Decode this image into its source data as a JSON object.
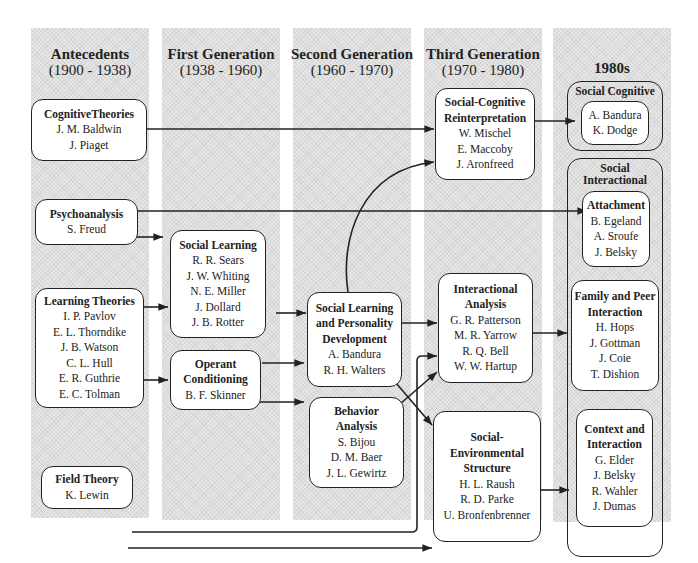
{
  "columns": [
    {
      "title": "Antecedents",
      "period": "(1900 - 1938)"
    },
    {
      "title": "First Generation",
      "period": "(1938 - 1960)"
    },
    {
      "title": "Second Generation",
      "period": "(1960 - 1970)"
    },
    {
      "title": "Third Generation",
      "period": "(1970 - 1980)"
    },
    {
      "title": "1980s",
      "period": ""
    }
  ],
  "nodes": {
    "cognitive_theories": {
      "title": "CognitiveTheories",
      "names": [
        "J. M. Baldwin",
        "J. Piaget"
      ]
    },
    "psychoanalysis": {
      "title": "Psychoanalysis",
      "names": [
        "S. Freud"
      ]
    },
    "learning_theories": {
      "title": "Learning Theories",
      "names": [
        "I. P. Pavlov",
        "E. L. Thorndike",
        "J. B. Watson",
        "C. L. Hull",
        "E. R. Guthrie",
        "E. C. Tolman"
      ]
    },
    "field_theory": {
      "title": "Field Theory",
      "names": [
        "K. Lewin"
      ]
    },
    "social_learning": {
      "title": "Social Learning",
      "names": [
        "R. R. Sears",
        "J. W. Whiting",
        "N. E. Miller",
        "J. Dollard",
        "J. B. Rotter"
      ]
    },
    "operant_conditioning": {
      "title_1": "Operant",
      "title_2": "Conditioning",
      "names": [
        "B. F. Skinner"
      ]
    },
    "social_learning_personality": {
      "title_1": "Social Learning",
      "title_2": "and Personality",
      "title_3": "Development",
      "names": [
        "A. Bandura",
        "R. H. Walters"
      ]
    },
    "behavior_analysis": {
      "title_1": "Behavior",
      "title_2": "Analysis",
      "names": [
        "S. Bijou",
        "D. M. Baer",
        "J. L. Gewirtz"
      ]
    },
    "social_cognitive_reinterpretation": {
      "title_1": "Social-Cognitive",
      "title_2": "Reinterpretation",
      "names": [
        "W. Mischel",
        "E. Maccoby",
        "J. Aronfreed"
      ]
    },
    "interactional_analysis": {
      "title_1": "Interactional",
      "title_2": "Analysis",
      "names": [
        "G. R. Patterson",
        "M. R. Yarrow",
        "R. Q. Bell",
        "W. W. Hartup"
      ]
    },
    "social_environmental_structure": {
      "title_1": "Social-",
      "title_2": "Environmental",
      "title_3": "Structure",
      "names": [
        "H. L. Raush",
        "R. D. Parke",
        "U. Bronfenbrenner"
      ]
    },
    "social_cognitive_group": {
      "label": "Social Cognitive",
      "names": [
        "A. Bandura",
        "K. Dodge"
      ]
    },
    "social_interactional_group": {
      "label": "Social Interactional"
    },
    "attachment": {
      "title": "Attachment",
      "names": [
        "B. Egeland",
        "A. Sroufe",
        "J. Belsky"
      ]
    },
    "family_peer": {
      "title_1": "Family and Peer",
      "title_2": "Interaction",
      "names": [
        "H. Hops",
        "J. Gottman",
        "J. Coie",
        "T. Dishion"
      ]
    },
    "context_interaction": {
      "title_1": "Context and",
      "title_2": "Interaction",
      "names": [
        "G. Elder",
        "J. Belsky",
        "R. Wahler",
        "J. Dumas"
      ]
    }
  },
  "edges": [
    {
      "from": "Cognitive Theories",
      "to": "Social-Cognitive Reinterpretation"
    },
    {
      "from": "Psychoanalysis",
      "to": "Attachment"
    },
    {
      "from": "Psychoanalysis",
      "to": "Social Learning"
    },
    {
      "from": "Learning Theories",
      "to": "Social Learning"
    },
    {
      "from": "Learning Theories",
      "to": "Operant Conditioning"
    },
    {
      "from": "Social Learning",
      "to": "Social Learning and Personality Development"
    },
    {
      "from": "Operant Conditioning",
      "to": "Social Learning and Personality Development"
    },
    {
      "from": "Operant Conditioning",
      "to": "Behavior Analysis"
    },
    {
      "from": "Social Learning and Personality Development",
      "to": "Social-Cognitive Reinterpretation"
    },
    {
      "from": "Social Learning and Personality Development",
      "to": "Interactional Analysis"
    },
    {
      "from": "Social Learning and Personality Development",
      "to": "Social-Environmental Structure"
    },
    {
      "from": "Behavior Analysis",
      "to": "Interactional Analysis"
    },
    {
      "from": "Field Theory",
      "to": "Interactional Analysis"
    },
    {
      "from": "Field Theory",
      "to": "Social-Environmental Structure"
    },
    {
      "from": "Social-Cognitive Reinterpretation",
      "to": "Social Cognitive"
    },
    {
      "from": "Interactional Analysis",
      "to": "Family and Peer Interaction"
    },
    {
      "from": "Social-Environmental Structure",
      "to": "Context and Interaction"
    }
  ]
}
